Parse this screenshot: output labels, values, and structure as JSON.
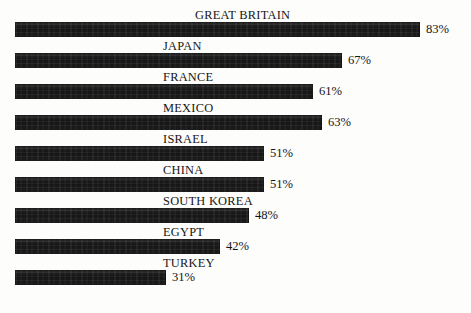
{
  "chart_data": {
    "type": "bar",
    "title": "",
    "subtitle": "",
    "xlabel": "",
    "ylabel": "",
    "orientation": "horizontal",
    "grid": false,
    "legend": false,
    "xlim": [
      0,
      100
    ],
    "value_suffix": "%",
    "categories": [
      "GREAT BRITAIN",
      "JAPAN",
      "FRANCE",
      "MEXICO",
      "ISRAEL",
      "CHINA",
      "SOUTH KOREA",
      "EGYPT",
      "TURKEY"
    ],
    "values": [
      83,
      67,
      61,
      63,
      51,
      51,
      48,
      42,
      31
    ],
    "value_labels": [
      "83%",
      "67%",
      "61%",
      "63%",
      "51%",
      "51%",
      "48%",
      "42%",
      "31%"
    ],
    "bar_color": "#1e1e1e",
    "background_color": "#fdfdfc",
    "text_color": "#161616"
  },
  "rows": [
    {
      "label": "GREAT BRITAIN",
      "value": 83,
      "value_label": "83%"
    },
    {
      "label": "JAPAN",
      "value": 67,
      "value_label": "67%"
    },
    {
      "label": "FRANCE",
      "value": 61,
      "value_label": "61%"
    },
    {
      "label": "MEXICO",
      "value": 63,
      "value_label": "63%"
    },
    {
      "label": "ISRAEL",
      "value": 51,
      "value_label": "51%"
    },
    {
      "label": "CHINA",
      "value": 51,
      "value_label": "51%"
    },
    {
      "label": "SOUTH KOREA",
      "value": 48,
      "value_label": "48%"
    },
    {
      "label": "EGYPT",
      "value": 42,
      "value_label": "42%"
    },
    {
      "label": "TURKEY",
      "value": 31,
      "value_label": "31%"
    }
  ],
  "layout": {
    "bar_origin_x": 15,
    "px_per_unit": 4.88,
    "row_height": 31,
    "first_row_top": 8,
    "label_left": 163,
    "wide_label_left": 195,
    "value_gap": 6
  }
}
